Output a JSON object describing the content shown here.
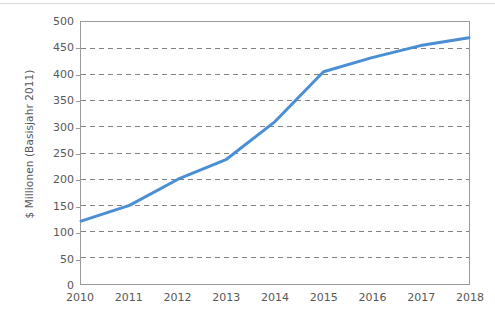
{
  "chart_data": {
    "type": "line",
    "title": "",
    "subtitle": "",
    "xlabel": "",
    "ylabel": "$ Millionen (Basisjahr 2011)",
    "x": [
      2010,
      2011,
      2012,
      2013,
      2014,
      2015,
      2016,
      2017,
      2018
    ],
    "categories": [
      "2010",
      "2011",
      "2012",
      "2013",
      "2014",
      "2015",
      "2016",
      "2017",
      "2018"
    ],
    "values": [
      120,
      150,
      200,
      238,
      310,
      405,
      432,
      455,
      470
    ],
    "series": [
      {
        "name": "",
        "color": "#4a8fd4",
        "values": [
          120,
          150,
          200,
          238,
          310,
          405,
          432,
          455,
          470
        ]
      }
    ],
    "ylim": [
      0,
      500
    ],
    "ytick_step": 50,
    "ytick_labels": [
      "0",
      "50",
      "100",
      "150",
      "200",
      "250",
      "300",
      "350",
      "400",
      "450",
      "500"
    ],
    "ytick_values": [
      0,
      50,
      100,
      150,
      200,
      250,
      300,
      350,
      400,
      450,
      500
    ],
    "xlim": [
      2010,
      2018
    ],
    "grid": {
      "horizontal": true,
      "vertical": false,
      "style": "dashed",
      "color": "#808080"
    },
    "legend": {
      "visible": false,
      "position": "none",
      "entries": []
    },
    "markers": false,
    "line_width": 3,
    "plot_border_color": "#9a9a9a",
    "background_color": "#ffffff"
  }
}
